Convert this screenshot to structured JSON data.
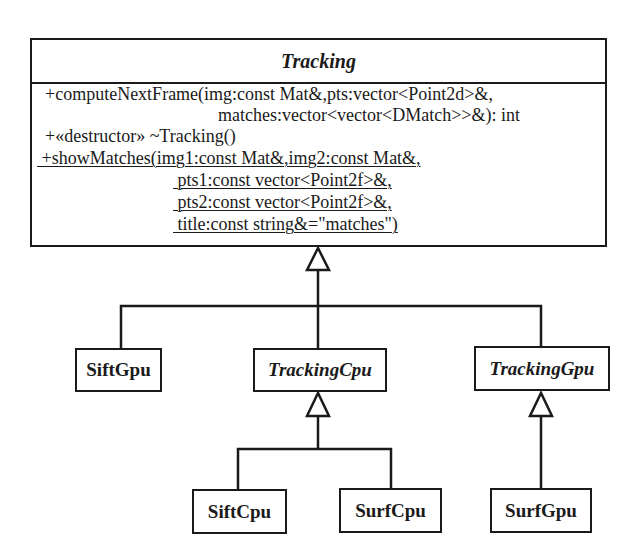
{
  "diagram": {
    "type": "UML class diagram",
    "base_class": {
      "name": "Tracking",
      "abstract": true,
      "operations": [
        {
          "lines": [
            "+computeNextFrame(img:const Mat&,pts:vector<Point2d>&,",
            "matches:vector<vector<DMatch>>&): int"
          ],
          "static": false
        },
        {
          "lines": [
            "+«destructor» ~Tracking()"
          ],
          "static": false
        },
        {
          "lines": [
            " +showMatches(img1:const Mat&,img2:const Mat&,",
            " pts1:const vector<Point2f>&,",
            " pts2:const vector<Point2f>&,",
            " title:const string&=\"matches\")"
          ],
          "static": true
        }
      ]
    },
    "classes": [
      {
        "name": "SiftGpu",
        "abstract": false,
        "parent": "Tracking"
      },
      {
        "name": "TrackingCpu",
        "abstract": true,
        "parent": "Tracking"
      },
      {
        "name": "TrackingGpu",
        "abstract": true,
        "parent": "Tracking"
      },
      {
        "name": "SiftCpu",
        "abstract": false,
        "parent": "TrackingCpu"
      },
      {
        "name": "SurfCpu",
        "abstract": false,
        "parent": "TrackingCpu"
      },
      {
        "name": "SurfGpu",
        "abstract": false,
        "parent": "TrackingGpu"
      }
    ],
    "relationship": "generalization",
    "line_color": "#1a1a1a"
  }
}
